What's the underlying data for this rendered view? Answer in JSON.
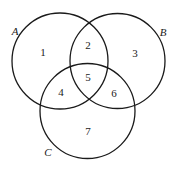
{
  "diagram": {
    "type": "venn",
    "sets": [
      {
        "label": "A",
        "cx": 60,
        "cy": 61,
        "r": 48,
        "label_x": 15,
        "label_y": 32
      },
      {
        "label": "B",
        "cx": 117.5,
        "cy": 61,
        "r": 47.5,
        "label_x": 163,
        "label_y": 33
      },
      {
        "label": "C",
        "cx": 87.5,
        "cy": 111,
        "r": 47.5,
        "label_x": 48,
        "label_y": 153
      }
    ],
    "regions": [
      {
        "label": "1",
        "x": 43,
        "y": 53
      },
      {
        "label": "2",
        "x": 88,
        "y": 46
      },
      {
        "label": "3",
        "x": 135,
        "y": 54
      },
      {
        "label": "4",
        "x": 61,
        "y": 93
      },
      {
        "label": "5",
        "x": 88,
        "y": 78
      },
      {
        "label": "6",
        "x": 114,
        "y": 94
      },
      {
        "label": "7",
        "x": 88,
        "y": 132
      }
    ]
  }
}
